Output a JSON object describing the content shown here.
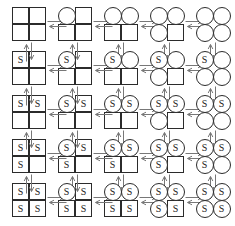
{
  "diagram": {
    "type": "state-transition-lattice",
    "grid": {
      "rows": 5,
      "cols": 5
    },
    "site_shapes": {
      "square": "square",
      "circle": "circle"
    },
    "site_label": "S",
    "colors": {
      "outline": "#2b2b2b",
      "arrow": "#777777",
      "background": "#ffffff",
      "label_text": "#1a1a1a"
    },
    "arrow_symbol": "equilibrium-double-arrow",
    "site_order": [
      "tl",
      "tr",
      "bl",
      "br"
    ],
    "states": [
      [
        {
          "id": "r1c1",
          "sites": [
            {
              "pos": "tl",
              "shape": "square",
              "label": ""
            },
            {
              "pos": "tr",
              "shape": "square",
              "label": ""
            },
            {
              "pos": "bl",
              "shape": "square",
              "label": ""
            },
            {
              "pos": "br",
              "shape": "square",
              "label": ""
            }
          ]
        },
        {
          "id": "r1c2",
          "sites": [
            {
              "pos": "tl",
              "shape": "circle",
              "label": ""
            },
            {
              "pos": "tr",
              "shape": "square",
              "label": ""
            },
            {
              "pos": "bl",
              "shape": "square",
              "label": ""
            },
            {
              "pos": "br",
              "shape": "square",
              "label": ""
            }
          ]
        },
        {
          "id": "r1c3",
          "sites": [
            {
              "pos": "tl",
              "shape": "circle",
              "label": ""
            },
            {
              "pos": "tr",
              "shape": "circle",
              "label": ""
            },
            {
              "pos": "bl",
              "shape": "square",
              "label": ""
            },
            {
              "pos": "br",
              "shape": "square",
              "label": ""
            }
          ]
        },
        {
          "id": "r1c4",
          "sites": [
            {
              "pos": "tl",
              "shape": "circle",
              "label": ""
            },
            {
              "pos": "tr",
              "shape": "circle",
              "label": ""
            },
            {
              "pos": "bl",
              "shape": "circle",
              "label": ""
            },
            {
              "pos": "br",
              "shape": "square",
              "label": ""
            }
          ]
        },
        {
          "id": "r1c5",
          "sites": [
            {
              "pos": "tl",
              "shape": "circle",
              "label": ""
            },
            {
              "pos": "tr",
              "shape": "circle",
              "label": ""
            },
            {
              "pos": "bl",
              "shape": "circle",
              "label": ""
            },
            {
              "pos": "br",
              "shape": "circle",
              "label": ""
            }
          ]
        }
      ],
      [
        {
          "id": "r2c1",
          "sites": [
            {
              "pos": "tl",
              "shape": "square",
              "label": "S"
            },
            {
              "pos": "tr",
              "shape": "square",
              "label": ""
            },
            {
              "pos": "bl",
              "shape": "square",
              "label": ""
            },
            {
              "pos": "br",
              "shape": "square",
              "label": ""
            }
          ]
        },
        {
          "id": "r2c2",
          "sites": [
            {
              "pos": "tl",
              "shape": "circle",
              "label": "S"
            },
            {
              "pos": "tr",
              "shape": "square",
              "label": ""
            },
            {
              "pos": "bl",
              "shape": "square",
              "label": ""
            },
            {
              "pos": "br",
              "shape": "square",
              "label": ""
            }
          ]
        },
        {
          "id": "r2c3",
          "sites": [
            {
              "pos": "tl",
              "shape": "circle",
              "label": "S"
            },
            {
              "pos": "tr",
              "shape": "circle",
              "label": ""
            },
            {
              "pos": "bl",
              "shape": "square",
              "label": ""
            },
            {
              "pos": "br",
              "shape": "square",
              "label": ""
            }
          ]
        },
        {
          "id": "r2c4",
          "sites": [
            {
              "pos": "tl",
              "shape": "circle",
              "label": "S"
            },
            {
              "pos": "tr",
              "shape": "circle",
              "label": ""
            },
            {
              "pos": "bl",
              "shape": "circle",
              "label": ""
            },
            {
              "pos": "br",
              "shape": "square",
              "label": ""
            }
          ]
        },
        {
          "id": "r2c5",
          "sites": [
            {
              "pos": "tl",
              "shape": "circle",
              "label": "S"
            },
            {
              "pos": "tr",
              "shape": "circle",
              "label": ""
            },
            {
              "pos": "bl",
              "shape": "circle",
              "label": ""
            },
            {
              "pos": "br",
              "shape": "circle",
              "label": ""
            }
          ]
        }
      ],
      [
        {
          "id": "r3c1",
          "sites": [
            {
              "pos": "tl",
              "shape": "square",
              "label": "S"
            },
            {
              "pos": "tr",
              "shape": "square",
              "label": "S"
            },
            {
              "pos": "bl",
              "shape": "square",
              "label": ""
            },
            {
              "pos": "br",
              "shape": "square",
              "label": ""
            }
          ]
        },
        {
          "id": "r3c2",
          "sites": [
            {
              "pos": "tl",
              "shape": "circle",
              "label": "S"
            },
            {
              "pos": "tr",
              "shape": "square",
              "label": "S"
            },
            {
              "pos": "bl",
              "shape": "square",
              "label": ""
            },
            {
              "pos": "br",
              "shape": "square",
              "label": ""
            }
          ]
        },
        {
          "id": "r3c3",
          "sites": [
            {
              "pos": "tl",
              "shape": "circle",
              "label": "S"
            },
            {
              "pos": "tr",
              "shape": "circle",
              "label": "S"
            },
            {
              "pos": "bl",
              "shape": "square",
              "label": ""
            },
            {
              "pos": "br",
              "shape": "square",
              "label": ""
            }
          ]
        },
        {
          "id": "r3c4",
          "sites": [
            {
              "pos": "tl",
              "shape": "circle",
              "label": "S"
            },
            {
              "pos": "tr",
              "shape": "circle",
              "label": "S"
            },
            {
              "pos": "bl",
              "shape": "circle",
              "label": ""
            },
            {
              "pos": "br",
              "shape": "square",
              "label": ""
            }
          ]
        },
        {
          "id": "r3c5",
          "sites": [
            {
              "pos": "tl",
              "shape": "circle",
              "label": "S"
            },
            {
              "pos": "tr",
              "shape": "circle",
              "label": "S"
            },
            {
              "pos": "bl",
              "shape": "circle",
              "label": ""
            },
            {
              "pos": "br",
              "shape": "circle",
              "label": ""
            }
          ]
        }
      ],
      [
        {
          "id": "r4c1",
          "sites": [
            {
              "pos": "tl",
              "shape": "square",
              "label": "S"
            },
            {
              "pos": "tr",
              "shape": "square",
              "label": "S"
            },
            {
              "pos": "bl",
              "shape": "square",
              "label": "S"
            },
            {
              "pos": "br",
              "shape": "square",
              "label": ""
            }
          ]
        },
        {
          "id": "r4c2",
          "sites": [
            {
              "pos": "tl",
              "shape": "circle",
              "label": "S"
            },
            {
              "pos": "tr",
              "shape": "square",
              "label": "S"
            },
            {
              "pos": "bl",
              "shape": "square",
              "label": "S"
            },
            {
              "pos": "br",
              "shape": "square",
              "label": ""
            }
          ]
        },
        {
          "id": "r4c3",
          "sites": [
            {
              "pos": "tl",
              "shape": "circle",
              "label": "S"
            },
            {
              "pos": "tr",
              "shape": "circle",
              "label": "S"
            },
            {
              "pos": "bl",
              "shape": "square",
              "label": "S"
            },
            {
              "pos": "br",
              "shape": "square",
              "label": ""
            }
          ]
        },
        {
          "id": "r4c4",
          "sites": [
            {
              "pos": "tl",
              "shape": "circle",
              "label": "S"
            },
            {
              "pos": "tr",
              "shape": "circle",
              "label": "S"
            },
            {
              "pos": "bl",
              "shape": "circle",
              "label": "S"
            },
            {
              "pos": "br",
              "shape": "square",
              "label": ""
            }
          ]
        },
        {
          "id": "r4c5",
          "sites": [
            {
              "pos": "tl",
              "shape": "circle",
              "label": "S"
            },
            {
              "pos": "tr",
              "shape": "circle",
              "label": "S"
            },
            {
              "pos": "bl",
              "shape": "circle",
              "label": "S"
            },
            {
              "pos": "br",
              "shape": "circle",
              "label": ""
            }
          ]
        }
      ],
      [
        {
          "id": "r5c1",
          "sites": [
            {
              "pos": "tl",
              "shape": "square",
              "label": "S"
            },
            {
              "pos": "tr",
              "shape": "square",
              "label": "S"
            },
            {
              "pos": "bl",
              "shape": "square",
              "label": "S"
            },
            {
              "pos": "br",
              "shape": "square",
              "label": "S"
            }
          ]
        },
        {
          "id": "r5c2",
          "sites": [
            {
              "pos": "tl",
              "shape": "circle",
              "label": "S"
            },
            {
              "pos": "tr",
              "shape": "square",
              "label": "S"
            },
            {
              "pos": "bl",
              "shape": "square",
              "label": "S"
            },
            {
              "pos": "br",
              "shape": "square",
              "label": "S"
            }
          ]
        },
        {
          "id": "r5c3",
          "sites": [
            {
              "pos": "tl",
              "shape": "circle",
              "label": "S"
            },
            {
              "pos": "tr",
              "shape": "circle",
              "label": "S"
            },
            {
              "pos": "bl",
              "shape": "square",
              "label": "S"
            },
            {
              "pos": "br",
              "shape": "square",
              "label": "S"
            }
          ]
        },
        {
          "id": "r5c4",
          "sites": [
            {
              "pos": "tl",
              "shape": "circle",
              "label": "S"
            },
            {
              "pos": "tr",
              "shape": "circle",
              "label": "S"
            },
            {
              "pos": "bl",
              "shape": "circle",
              "label": "S"
            },
            {
              "pos": "br",
              "shape": "square",
              "label": "S"
            }
          ]
        },
        {
          "id": "r5c5",
          "sites": [
            {
              "pos": "tl",
              "shape": "circle",
              "label": "S"
            },
            {
              "pos": "tr",
              "shape": "circle",
              "label": "S"
            },
            {
              "pos": "bl",
              "shape": "circle",
              "label": "S"
            },
            {
              "pos": "br",
              "shape": "circle",
              "label": "S"
            }
          ]
        }
      ]
    ]
  }
}
